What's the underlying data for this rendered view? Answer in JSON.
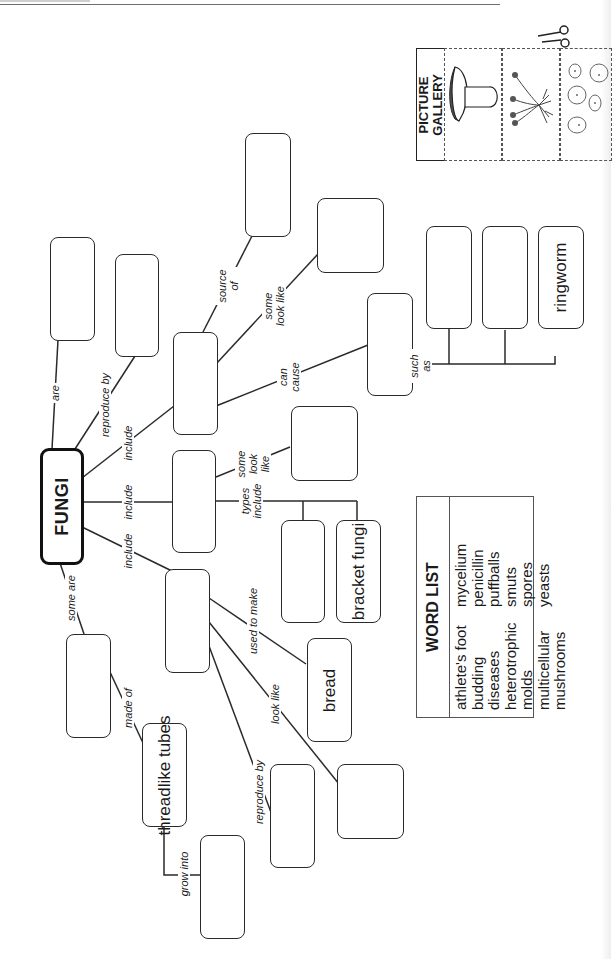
{
  "page": {
    "orientation": "rotated 90deg counter-clockwise",
    "line_color": "#2a2a2a"
  },
  "concept_map": {
    "center": {
      "label": "FUNGI"
    },
    "boxes": [
      {
        "id": "are",
        "label": ""
      },
      {
        "id": "reproduce-by",
        "label": ""
      },
      {
        "id": "include-1",
        "label": ""
      },
      {
        "id": "source-of",
        "label": ""
      },
      {
        "id": "some-look-like-1",
        "label": ""
      },
      {
        "id": "can-cause",
        "label": ""
      },
      {
        "id": "such-as-1",
        "label": ""
      },
      {
        "id": "such-as-2",
        "label": ""
      },
      {
        "id": "such-as-3",
        "label": "ringworm"
      },
      {
        "id": "include-2",
        "label": ""
      },
      {
        "id": "some-look-like-2",
        "label": ""
      },
      {
        "id": "types-include-1",
        "label": ""
      },
      {
        "id": "types-include-2",
        "label": "bracket fungi"
      },
      {
        "id": "include-3",
        "label": ""
      },
      {
        "id": "used-to-make",
        "label": "bread"
      },
      {
        "id": "look-like",
        "label": ""
      },
      {
        "id": "reproduce-by-2",
        "label": ""
      },
      {
        "id": "some-are",
        "label": ""
      },
      {
        "id": "made-of",
        "label": "threadlike tubes"
      },
      {
        "id": "grow-into",
        "label": ""
      }
    ],
    "links": {
      "are": "are",
      "reproduce_by": "reproduce by",
      "include_a": "include",
      "include_b": "include",
      "include_c": "include",
      "source_of": "source of",
      "some_look_like_a": "some look like",
      "can_cause": "can cause",
      "such_as": "such as",
      "some_look_like_b": "some look like",
      "types_include": "types include",
      "used_to_make": "used to make",
      "look_like": "look like",
      "reproduce_by_b": "reproduce by",
      "some_are": "some are",
      "made_of": "made of",
      "grow_into": "grow into"
    }
  },
  "word_list": {
    "title": "WORD LIST",
    "column_1": [
      "athlete's foot",
      "budding",
      "diseases",
      "heterotrophic",
      "molds",
      "multicellular",
      "mushrooms"
    ],
    "column_2": [
      "mycelium",
      "penicillin",
      "puffballs",
      "smuts",
      "spores",
      "yeasts"
    ]
  },
  "picture_gallery": {
    "title": "PICTURE GALLERY",
    "images": [
      "mushroom-icon",
      "mold-sporangia-icon",
      "yeast-cells-icon"
    ],
    "cut_icon": "scissors-icon"
  }
}
